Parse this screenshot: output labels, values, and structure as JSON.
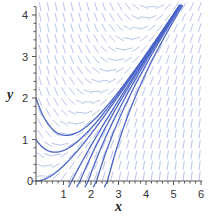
{
  "chart_data": {
    "type": "line",
    "subtype": "direction-field",
    "title": "",
    "xlabel": "x",
    "ylabel": "y",
    "xlim": [
      0,
      6
    ],
    "ylim": [
      0,
      4.2
    ],
    "x_ticks": [
      "0",
      "1",
      "2",
      "3",
      "4",
      "5",
      "6"
    ],
    "y_ticks": [
      "1",
      "2",
      "3",
      "4"
    ],
    "grid": false,
    "legend": null,
    "field_equation": "dy/dx = x - y",
    "series": [
      {
        "name": "solution y(0)=2",
        "start": [
          0,
          2
        ]
      },
      {
        "name": "solution y(0)=1",
        "start": [
          0,
          1
        ]
      },
      {
        "name": "solution y(0)=0",
        "start": [
          0,
          0
        ]
      },
      {
        "name": "solution y(1.3)=0",
        "start": [
          1.3,
          0
        ]
      },
      {
        "name": "solution y(1.6)=0",
        "start": [
          1.6,
          0
        ]
      },
      {
        "name": "solution y(1.9)=0",
        "start": [
          1.9,
          0
        ]
      },
      {
        "name": "solution y(2.2)=0",
        "start": [
          2.2,
          0
        ]
      },
      {
        "name": "solution y(2.6)=0",
        "start": [
          2.6,
          0
        ]
      }
    ],
    "colors": {
      "field": "#b9c6ea",
      "curve": "#4a63c8",
      "axis": "#555555"
    }
  },
  "labels": {
    "x": "x",
    "y": "y",
    "origin": "0"
  }
}
